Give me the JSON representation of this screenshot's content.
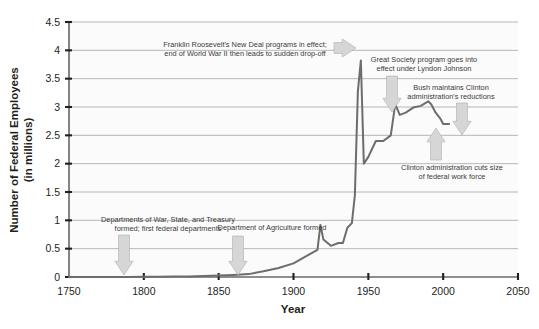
{
  "chart_data": {
    "type": "line",
    "title": "",
    "xlabel": "Year",
    "ylabel": "Number of Federal Employees (in millions)",
    "ylabel_line1": "Number of Federal Employees",
    "ylabel_line2": "(in millions)",
    "xlim": [
      1750,
      2050
    ],
    "ylim": [
      0,
      4.5
    ],
    "xticks": [
      1750,
      1800,
      1850,
      1900,
      1950,
      2000,
      2050
    ],
    "yticks": [
      0,
      0.5,
      1,
      1.5,
      2,
      2.5,
      3,
      3.5,
      4,
      4.5
    ],
    "xtick_labels": [
      "1750",
      "1800",
      "1850",
      "1900",
      "1950",
      "2000",
      "2050"
    ],
    "ytick_labels": [
      "0",
      "0.5",
      "1",
      "1.5",
      "2",
      "2.5",
      "3",
      "3.5",
      "4",
      "4.5"
    ],
    "grid": "horizontal",
    "legend": "none",
    "series": [
      {
        "name": "Federal civilian employees",
        "x": [
          1750,
          1790,
          1800,
          1810,
          1820,
          1830,
          1840,
          1850,
          1860,
          1870,
          1880,
          1890,
          1900,
          1910,
          1916,
          1918,
          1920,
          1925,
          1930,
          1933,
          1936,
          1939,
          1941,
          1943,
          1945,
          1947,
          1950,
          1955,
          1960,
          1965,
          1968,
          1971,
          1975,
          1980,
          1985,
          1990,
          1992,
          1995,
          1998,
          2000,
          2002,
          2004
        ],
        "y": [
          0.0,
          0.0,
          0.003,
          0.004,
          0.007,
          0.011,
          0.018,
          0.026,
          0.037,
          0.051,
          0.1,
          0.16,
          0.24,
          0.39,
          0.48,
          0.92,
          0.66,
          0.55,
          0.6,
          0.6,
          0.87,
          0.95,
          1.44,
          3.27,
          3.82,
          2.0,
          2.12,
          2.4,
          2.4,
          2.5,
          3.05,
          2.86,
          2.9,
          2.99,
          3.02,
          3.1,
          3.05,
          2.9,
          2.8,
          2.7,
          2.7,
          2.7
        ]
      }
    ],
    "annotations": [
      {
        "id": "new-deal",
        "text_lines": [
          "Franklin Roosevelt's New Deal programs in effect;",
          "end of World War II then leads to sudden drop-off"
        ],
        "text_x": 245,
        "text_y": 47,
        "align": "middle",
        "arrow_direction": "right",
        "arrow_x": 334,
        "arrow_y": 48,
        "arrow_length": 22,
        "arrow_thickness": 11
      },
      {
        "id": "great-society",
        "text_lines": [
          "Great Society program goes into",
          "effect under Lyndon Johnson"
        ],
        "text_x": 424,
        "text_y": 62,
        "align": "middle",
        "arrow_direction": "down",
        "arrow_x": 392,
        "arrow_y": 76,
        "arrow_length": 36,
        "arrow_thickness": 11
      },
      {
        "id": "bush-maintains",
        "text_lines": [
          "Bush maintains Clinton",
          "administration's reductions"
        ],
        "text_x": 451,
        "text_y": 90,
        "align": "middle",
        "arrow_direction": "down",
        "arrow_x": 462,
        "arrow_y": 103,
        "arrow_length": 32,
        "arrow_thickness": 11
      },
      {
        "id": "clinton-cuts",
        "text_lines": [
          "Clinton administration cuts size",
          "of federal work force"
        ],
        "text_x": 452,
        "text_y": 170,
        "align": "middle",
        "arrow_direction": "up",
        "arrow_x": 436,
        "arrow_y": 128,
        "arrow_length": 32,
        "arrow_thickness": 11
      },
      {
        "id": "departments-formed",
        "text_lines": [
          "Departments of War, State, and Treasury",
          "formed; first federal departments"
        ],
        "text_x": 168,
        "text_y": 222,
        "align": "middle",
        "arrow_direction": "down",
        "arrow_x": 124,
        "arrow_y": 235,
        "arrow_length": 40,
        "arrow_thickness": 11
      },
      {
        "id": "agriculture-formed",
        "text_lines": [
          "Department of Agriculture formed"
        ],
        "text_x": 272,
        "text_y": 230,
        "align": "middle",
        "arrow_direction": "down",
        "arrow_x": 238,
        "arrow_y": 236,
        "arrow_length": 39,
        "arrow_thickness": 11
      }
    ]
  },
  "style": {
    "line_color": "#6d6d6d",
    "grid_color": "#9b9b9b",
    "axis_color": "#231f20",
    "arrow_fill": "#d6d6d6",
    "arrow_stroke": "#aeaeae",
    "plot_background": "#fbfbfb",
    "page_background": "#ffffff"
  },
  "plot_geometry": {
    "left": 69,
    "right": 518,
    "top": 22,
    "bottom": 277
  }
}
